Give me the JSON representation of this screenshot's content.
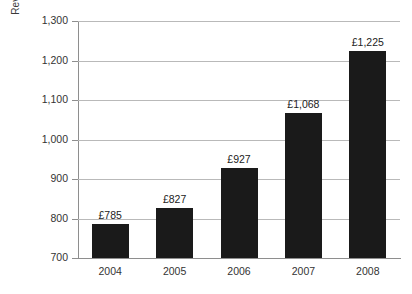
{
  "chart_data": {
    "type": "bar",
    "title": "",
    "subtitle": "",
    "xlabel": "",
    "ylabel": "Revenue Oustanding (£m)",
    "categories": [
      "2004",
      "2005",
      "2006",
      "2007",
      "2008"
    ],
    "values": [
      785,
      827,
      927,
      1068,
      1225
    ],
    "data_labels": [
      "£785",
      "£827",
      "£927",
      "£1,068",
      "£1,225"
    ],
    "ylim": [
      700,
      1300
    ],
    "yticks": [
      700,
      800,
      900,
      1000,
      1100,
      1200,
      1300
    ],
    "ytick_labels": [
      "700",
      "800",
      "900",
      "1,000",
      "1,100",
      "1,200",
      "1,300"
    ],
    "grid": "horizontal",
    "legend": "none",
    "series": [
      {
        "name": "Revenue Oustanding (£m)",
        "values": [
          785,
          827,
          927,
          1068,
          1225
        ]
      }
    ]
  },
  "colors": {
    "bar_fill": "#1a1a1a",
    "gridline": "#b9b9b9",
    "axis_line": "#8e8e8e",
    "tick_text": "#333333",
    "value_text": "#222222",
    "axis_title_text": "#3a3a3a",
    "background": "#ffffff"
  }
}
